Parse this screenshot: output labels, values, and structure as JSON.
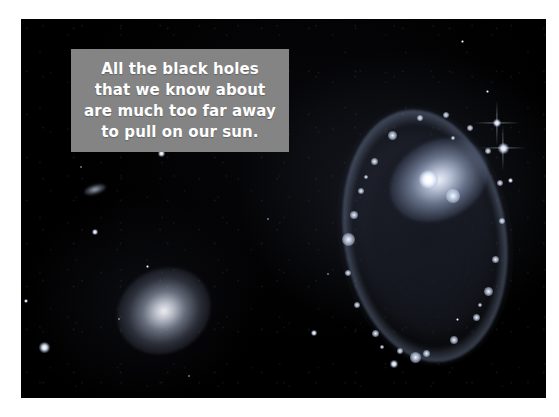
{
  "page": {
    "background_color": "#ffffff",
    "width": 559,
    "height": 417
  },
  "photo": {
    "name": "astronomy-photograph",
    "background_color": "#000000",
    "description": "Deep-sky photograph of a ring galaxy and a companion elliptical galaxy against a black star field"
  },
  "caption": {
    "text": "All the black holes\nthat we know about\nare much too far away\nto pull on our sun.",
    "lines": [
      "All the black holes",
      "that we know about",
      "are much too far away",
      "to pull on our sun."
    ],
    "background_color": "#848484",
    "text_color": "#ffffff"
  },
  "objects": {
    "ring_galaxy": {
      "label": "ring-galaxy",
      "ring_color": "#bacaeb",
      "core_color": "#ffffff"
    },
    "elliptical_galaxy": {
      "label": "elliptical-galaxy",
      "core_color": "#fcfcff"
    },
    "faint_galaxy": {
      "label": "faint-background-galaxy"
    },
    "stars": [
      {
        "x": 140,
        "y": 134,
        "size": 7,
        "spiked": false
      },
      {
        "x": 74,
        "y": 213,
        "size": 6,
        "spiked": false
      },
      {
        "x": 5,
        "y": 282,
        "size": 4,
        "spiked": false
      },
      {
        "x": 23,
        "y": 328,
        "size": 11,
        "spiked": false
      },
      {
        "x": 126,
        "y": 247,
        "size": 3,
        "spiked": false
      },
      {
        "x": 476,
        "y": 104,
        "size": 8,
        "spiked": true
      },
      {
        "x": 482,
        "y": 129,
        "size": 11,
        "spiked": true
      },
      {
        "x": 489,
        "y": 161,
        "size": 5,
        "spiked": false
      },
      {
        "x": 466,
        "y": 72,
        "size": 3,
        "spiked": false
      },
      {
        "x": 441,
        "y": 22,
        "size": 3,
        "spiked": false
      },
      {
        "x": 293,
        "y": 314,
        "size": 6,
        "spiked": false
      },
      {
        "x": 373,
        "y": 345,
        "size": 8,
        "spiked": false
      },
      {
        "x": 196,
        "y": 88,
        "size": 3,
        "spiked": false
      },
      {
        "x": 247,
        "y": 200,
        "size": 2,
        "spiked": false
      },
      {
        "x": 307,
        "y": 255,
        "size": 2,
        "spiked": false
      },
      {
        "x": 98,
        "y": 300,
        "size": 2,
        "spiked": false
      },
      {
        "x": 168,
        "y": 357,
        "size": 2,
        "spiked": false
      },
      {
        "x": 436,
        "y": 300,
        "size": 3,
        "spiked": false
      },
      {
        "x": 119,
        "y": 36,
        "size": 2,
        "spiked": false
      },
      {
        "x": 60,
        "y": 148,
        "size": 2,
        "spiked": false
      }
    ],
    "ring_knots": [
      {
        "x": 18,
        "y": 140,
        "size": 13
      },
      {
        "x": 24,
        "y": 116,
        "size": 8
      },
      {
        "x": 31,
        "y": 92,
        "size": 6
      },
      {
        "x": 44,
        "y": 62,
        "size": 7
      },
      {
        "x": 62,
        "y": 36,
        "size": 9
      },
      {
        "x": 90,
        "y": 19,
        "size": 6
      },
      {
        "x": 116,
        "y": 16,
        "size": 6
      },
      {
        "x": 140,
        "y": 29,
        "size": 6
      },
      {
        "x": 158,
        "y": 52,
        "size": 6
      },
      {
        "x": 170,
        "y": 84,
        "size": 6
      },
      {
        "x": 172,
        "y": 122,
        "size": 6
      },
      {
        "x": 165,
        "y": 160,
        "size": 7
      },
      {
        "x": 158,
        "y": 192,
        "size": 9
      },
      {
        "x": 146,
        "y": 218,
        "size": 7
      },
      {
        "x": 124,
        "y": 241,
        "size": 8
      },
      {
        "x": 96,
        "y": 254,
        "size": 7
      },
      {
        "x": 70,
        "y": 252,
        "size": 6
      },
      {
        "x": 45,
        "y": 234,
        "size": 7
      },
      {
        "x": 27,
        "y": 206,
        "size": 6
      },
      {
        "x": 18,
        "y": 174,
        "size": 6
      },
      {
        "x": 85,
        "y": 258,
        "size": 11
      },
      {
        "x": 123,
        "y": 39,
        "size": 4
      },
      {
        "x": 36,
        "y": 78,
        "size": 4
      },
      {
        "x": 150,
        "y": 206,
        "size": 4
      },
      {
        "x": 52,
        "y": 248,
        "size": 4
      }
    ],
    "companion_knot": {
      "x": 123,
      "y": 97,
      "size": 14
    }
  }
}
